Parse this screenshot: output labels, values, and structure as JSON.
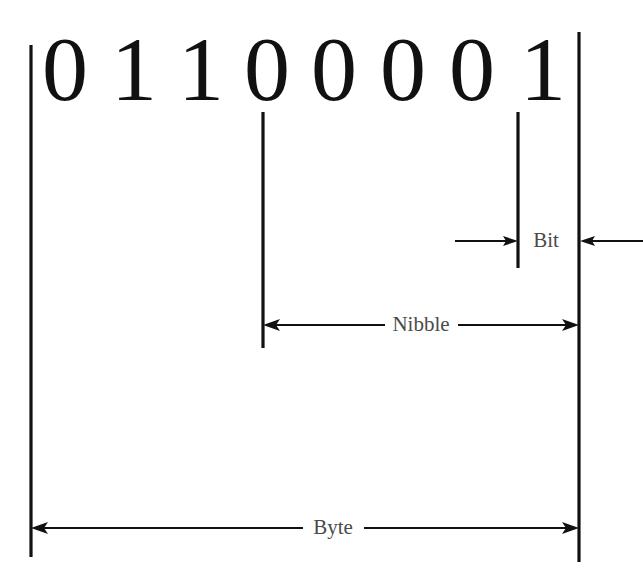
{
  "diagram": {
    "binary_value": "01100001",
    "digits": [
      {
        "char": "0",
        "x": 65
      },
      {
        "char": "1",
        "x": 134
      },
      {
        "char": "1",
        "x": 201
      },
      {
        "char": "0",
        "x": 267
      },
      {
        "char": "0",
        "x": 334
      },
      {
        "char": "0",
        "x": 403
      },
      {
        "char": "0",
        "x": 472
      },
      {
        "char": "1",
        "x": 543
      }
    ],
    "digit_baseline_y": 100,
    "colors": {
      "stroke": "#111111",
      "label": "#4a4a4a",
      "background": "#ffffff"
    },
    "guides": [
      {
        "name": "byte-left-guide",
        "x": 31,
        "y1": 45,
        "y2": 557
      },
      {
        "name": "nibble-left-guide",
        "x": 263,
        "y1": 112,
        "y2": 348
      },
      {
        "name": "bit-left-guide",
        "x": 518,
        "y1": 112,
        "y2": 268
      },
      {
        "name": "byte-right-guide",
        "x": 579,
        "y1": 32,
        "y2": 562
      }
    ],
    "dimensions": [
      {
        "name": "bit",
        "label": "Bit",
        "label_x": 546,
        "label_y": 242,
        "y": 241,
        "style": "outward",
        "left_segment": {
          "x1": 455,
          "x2": 518
        },
        "right_segment": {
          "x1": 643,
          "x2": 580
        }
      },
      {
        "name": "nibble",
        "label": "Nibble",
        "label_x": 421,
        "label_y": 326,
        "y": 325,
        "style": "inward",
        "left_segment": {
          "x1": 263,
          "x2": 385
        },
        "right_segment": {
          "x1": 579,
          "x2": 458
        }
      },
      {
        "name": "byte",
        "label": "Byte",
        "label_x": 333,
        "label_y": 529,
        "y": 528,
        "style": "inward",
        "left_segment": {
          "x1": 31,
          "x2": 303
        },
        "right_segment": {
          "x1": 579,
          "x2": 364
        }
      }
    ]
  }
}
